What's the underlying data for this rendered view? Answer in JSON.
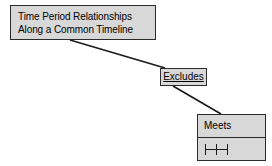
{
  "diagram": {
    "background_color": "#ffffff",
    "node_fill_color": "#d8d8d8",
    "node_border_color": "#2b2b2b",
    "connector_color": "#1a1a1a",
    "root": {
      "line1": "Time Period Relationships",
      "line2": "Along a Common Timeline"
    },
    "relationship": {
      "label": "Excludes"
    },
    "leaf": {
      "name": "Meets",
      "symbol": "|-|-|",
      "symbol_icon": "interval-meets-icon"
    },
    "connectors": [
      {
        "name": "root-to-excludes",
        "from": "Time Period Relationships Along a Common Timeline",
        "to": "Excludes",
        "x1": 70,
        "y1": 40,
        "x2": 165,
        "y2": 68
      },
      {
        "name": "excludes-to-meets",
        "from": "Excludes",
        "to": "Meets",
        "x1": 173,
        "y1": 86,
        "x2": 221,
        "y2": 114
      }
    ]
  }
}
